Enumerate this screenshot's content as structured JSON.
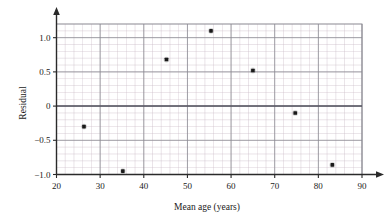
{
  "chart_data": {
    "type": "scatter",
    "title": "",
    "xlabel": "Mean age (years)",
    "ylabel": "Residual",
    "xlim": [
      20,
      90
    ],
    "ylim": [
      -1.0,
      1.2
    ],
    "xticks": [
      20,
      30,
      40,
      50,
      60,
      70,
      80,
      90
    ],
    "xtick_labels": [
      "20",
      "30",
      "40",
      "50",
      "60",
      "70",
      "80",
      "90"
    ],
    "yticks": [
      -1.0,
      -0.5,
      0,
      0.5,
      1.0
    ],
    "ytick_labels": [
      "−1.0",
      "−0.5",
      "0",
      "0.5",
      "1.0"
    ],
    "grid": true,
    "grid_minor_x_step": 2,
    "grid_minor_y_step": 0.1,
    "grid_major_y_step": 0.5,
    "legend": null,
    "zero_reference_line": 0,
    "x": [
      26.3,
      35.2,
      45.2,
      55.4,
      65.0,
      74.7,
      83.2
    ],
    "y": [
      -0.3,
      -0.95,
      0.68,
      1.1,
      0.52,
      -0.1,
      -0.86
    ],
    "points": [
      {
        "x": 26.3,
        "y": -0.3
      },
      {
        "x": 35.2,
        "y": -0.95
      },
      {
        "x": 45.2,
        "y": 0.68
      },
      {
        "x": 55.4,
        "y": 1.1
      },
      {
        "x": 65.0,
        "y": 0.52
      },
      {
        "x": 74.7,
        "y": -0.1
      },
      {
        "x": 83.2,
        "y": -0.86
      }
    ],
    "marker": "filled-square-dot",
    "marker_color": "#1a1a1a",
    "point_count": 7
  },
  "colors": {
    "marker": "#1a1a1a",
    "grid_minor": "#c9b8c4",
    "grid_major": "#8a8a92",
    "axis": "#2a2a2a",
    "zero_line": "#555560",
    "background": "#ffffff"
  }
}
